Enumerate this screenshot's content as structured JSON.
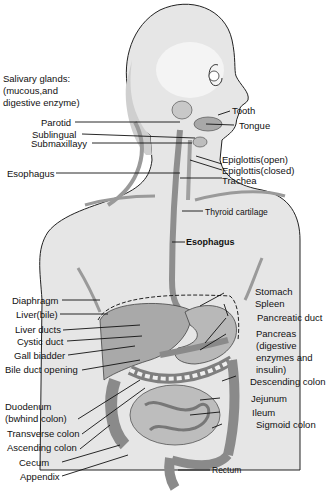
{
  "colors": {
    "background": "#ffffff",
    "skin": "#e4e4e4",
    "skin_light": "#efefef",
    "organ_dark": "#9a9a9a",
    "organ_mid": "#bcbcbc",
    "outline": "#222222",
    "leader": "#111111"
  },
  "header_note": {
    "line1": "Salivary glands:",
    "line2": "(mucous,and",
    "line3": "digestive enzyme)"
  },
  "labels_left": [
    {
      "id": "parotid",
      "text": "Parotid"
    },
    {
      "id": "sublingual",
      "text": "Sublingual"
    },
    {
      "id": "submaxillary",
      "text": "Submaxillayy"
    },
    {
      "id": "esophagus_upper",
      "text": "Esophagus"
    },
    {
      "id": "diaphragm",
      "text": "Diaphragm"
    },
    {
      "id": "liver",
      "text": "Liver(bile)"
    },
    {
      "id": "liver_ducts",
      "text": "Liver ducts"
    },
    {
      "id": "cystic_duct",
      "text": "Cystic duct"
    },
    {
      "id": "gall_bladder",
      "text": "Gall biadder"
    },
    {
      "id": "bile_duct_opening",
      "text": "Bile duct opening"
    },
    {
      "id": "duodenum_1",
      "text": "Duodenum"
    },
    {
      "id": "duodenum_2",
      "text": "(bwhind colon)"
    },
    {
      "id": "transverse_colon",
      "text": "Transverse colon"
    },
    {
      "id": "ascending_colon",
      "text": "Ascending colon"
    },
    {
      "id": "cecum",
      "text": "Cecum"
    },
    {
      "id": "appendix",
      "text": "Appendix"
    }
  ],
  "labels_right": [
    {
      "id": "tooth",
      "text": "Tooth"
    },
    {
      "id": "tongue",
      "text": "Tongue"
    },
    {
      "id": "epiglottis_open",
      "text": "Epiglottis(open)"
    },
    {
      "id": "epiglottis_closed",
      "text": "Epiglottis(closed)"
    },
    {
      "id": "trachea",
      "text": "Trachea"
    },
    {
      "id": "thyroid_cartilage",
      "text": "Thyroid cartilage"
    },
    {
      "id": "esophagus_main",
      "text": "Esophagus"
    },
    {
      "id": "stomach",
      "text": "Stomach"
    },
    {
      "id": "spleen",
      "text": "Spleen"
    },
    {
      "id": "pancreatic_duct",
      "text": "Pancreatic duct"
    },
    {
      "id": "pancreas_1",
      "text": "Pancreas"
    },
    {
      "id": "pancreas_2",
      "text": "(digestive"
    },
    {
      "id": "pancreas_3",
      "text": "enzymes and"
    },
    {
      "id": "pancreas_4",
      "text": "insulin)"
    },
    {
      "id": "descending_colon",
      "text": "Descending colon"
    },
    {
      "id": "jejunum",
      "text": "Jejunum"
    },
    {
      "id": "ileum",
      "text": "Ileum"
    },
    {
      "id": "sigmoid_colon",
      "text": "Sigmoid colon"
    },
    {
      "id": "rectum",
      "text": "Rectum"
    }
  ]
}
